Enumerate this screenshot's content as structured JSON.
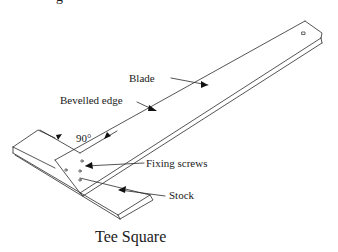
{
  "figure": {
    "caption": "Tee Square",
    "partial_top_text": "g",
    "labels": {
      "blade": "Blade",
      "bevelled_edge": "Bevelled edge",
      "angle": "90°",
      "fixing_screws": "Fixing screws",
      "stock": "Stock"
    },
    "colors": {
      "line": "#2a2a2a",
      "background": "#ffffff"
    }
  }
}
